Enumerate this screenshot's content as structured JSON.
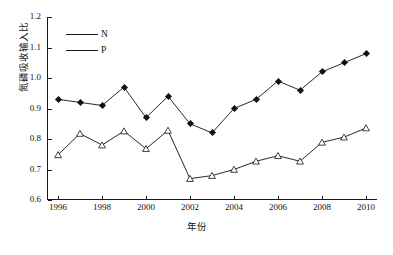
{
  "chart_data": {
    "type": "line",
    "title": "",
    "xlabel": "年份",
    "ylabel": "氮磷吸收输入比",
    "x": [
      1996,
      1997,
      1998,
      1999,
      2000,
      2001,
      2002,
      2003,
      2004,
      2005,
      2006,
      2007,
      2008,
      2009,
      2010
    ],
    "xlim": [
      1995.5,
      2010.5
    ],
    "ylim": [
      0.6,
      1.2
    ],
    "grid": false,
    "legend_position": "upper-left",
    "xticks": [
      "1996",
      "1998",
      "2000",
      "2002",
      "2004",
      "2006",
      "2008",
      "2010"
    ],
    "xtick_values": [
      1996,
      1998,
      2000,
      2002,
      2004,
      2006,
      2008,
      2010
    ],
    "yticks": [
      "0.6",
      "0.7",
      "0.8",
      "0.9",
      "1.0",
      "1.1",
      "1.2"
    ],
    "ytick_values": [
      0.6,
      0.7,
      0.8,
      0.9,
      1.0,
      1.1,
      1.2
    ],
    "series": [
      {
        "name": "N",
        "marker": "filled-diamond",
        "color": "#111111",
        "values": [
          0.93,
          0.92,
          0.91,
          0.97,
          0.87,
          0.94,
          0.85,
          0.82,
          0.9,
          0.93,
          0.99,
          0.96,
          1.02,
          1.05,
          1.08
        ]
      },
      {
        "name": "P",
        "marker": "open-triangle",
        "color": "#111111",
        "values": [
          0.748,
          0.818,
          0.78,
          0.826,
          0.768,
          0.828,
          0.67,
          0.68,
          0.7,
          0.727,
          0.745,
          0.727,
          0.789,
          0.806,
          0.836
        ]
      }
    ]
  },
  "legend": {
    "items": [
      {
        "label": "N"
      },
      {
        "label": "P"
      }
    ]
  }
}
